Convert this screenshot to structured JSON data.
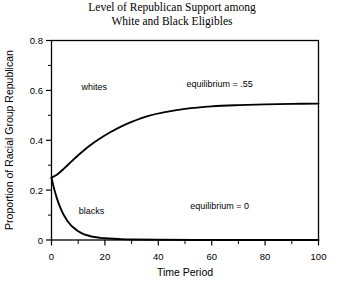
{
  "chart_data": {
    "type": "line",
    "title": "Level of Republican Support among White and Black Eligibles",
    "title_lines": [
      "Level of Republican Support among",
      "White and Black Eligibles"
    ],
    "xlabel": "Time Period",
    "ylabel": "Proportion of Racial Group Republican",
    "xlim": [
      0,
      100
    ],
    "ylim": [
      0,
      0.8
    ],
    "xticks": [
      0,
      20,
      40,
      60,
      80,
      100
    ],
    "xtick_labels": [
      "0",
      "20",
      "40",
      "60",
      "80",
      "100"
    ],
    "xminor_step": 10,
    "yticks": [
      0,
      0.2,
      0.4,
      0.6,
      0.8
    ],
    "ytick_labels": [
      "0",
      "0.2",
      "0.4",
      "0.6",
      "0.8"
    ],
    "yminor_step": 0.1,
    "grid": false,
    "legend": "inline-curve-labels",
    "frame": "full-box",
    "series": [
      {
        "name": "whites",
        "label": "whites",
        "color": "#000000",
        "x": [
          0,
          2,
          4,
          6,
          8,
          10,
          14,
          18,
          22,
          26,
          30,
          36,
          42,
          50,
          60,
          70,
          80,
          90,
          100
        ],
        "y": [
          0.25,
          0.262,
          0.28,
          0.3,
          0.32,
          0.34,
          0.376,
          0.406,
          0.432,
          0.455,
          0.474,
          0.497,
          0.512,
          0.526,
          0.536,
          0.541,
          0.544,
          0.546,
          0.547
        ]
      },
      {
        "name": "blacks",
        "label": "blacks",
        "color": "#000000",
        "x": [
          0,
          1,
          2,
          3,
          4,
          5,
          6,
          7,
          8,
          10,
          12,
          14,
          16,
          18,
          20,
          25,
          30,
          40,
          60,
          80,
          100
        ],
        "y": [
          0.25,
          0.205,
          0.168,
          0.138,
          0.113,
          0.093,
          0.076,
          0.063,
          0.052,
          0.035,
          0.024,
          0.017,
          0.012,
          0.009,
          0.007,
          0.004,
          0.002,
          0.001,
          0.0,
          0.0,
          0.0
        ]
      }
    ],
    "annotations": [
      {
        "name": "equilibrium-whites",
        "text": "equilibrium = .55",
        "x": 63,
        "y": 0.615
      },
      {
        "name": "equilibrium-blacks",
        "text": "equilibrium = 0",
        "x": 63,
        "y": 0.125
      }
    ],
    "curve_labels": [
      {
        "name": "whites",
        "text": "whites",
        "x": 16,
        "y": 0.6
      },
      {
        "name": "blacks",
        "text": "blacks",
        "x": 15,
        "y": 0.105
      }
    ]
  }
}
